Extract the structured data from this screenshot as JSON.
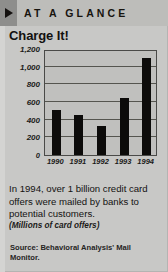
{
  "header": {
    "arrow_icon": "play-triangle-icon",
    "kicker": "AT A GLANCE"
  },
  "headline": "Charge It!",
  "deck": "In 1994, over 1 billion credit card offers were mailed by banks to potential customers.",
  "units_note": "(Millions of card offers)",
  "source": "Source: Behavioral Analysis' Mail Monitor.",
  "colors": {
    "page_background": "#c8c8c6",
    "header_band": "#bdbdba",
    "arrow_box": "#8e8e8c",
    "plot_background": "#c0c0be",
    "bar": "#0c0b0a",
    "gridline": "#55554f",
    "text": "#131211"
  },
  "chart_data": {
    "type": "bar",
    "title": "Charge It!",
    "subtitle": "(Millions of card offers)",
    "xlabel": "",
    "ylabel": "",
    "categories": [
      "1990",
      "1991",
      "1992",
      "1993",
      "1994"
    ],
    "values": [
      510,
      455,
      330,
      650,
      1100
    ],
    "ylim": [
      0,
      1200
    ],
    "yticks": [
      0,
      200,
      400,
      600,
      800,
      1000,
      1200
    ],
    "ytick_labels": [
      "0",
      "200",
      "400",
      "600",
      "800",
      "1,000",
      "1,200"
    ],
    "grid": true,
    "legend": false,
    "source": "Source: Behavioral Analysis' Mail Monitor."
  }
}
